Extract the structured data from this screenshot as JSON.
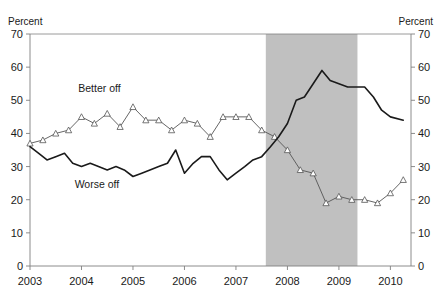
{
  "chart_data": {
    "type": "line",
    "title": "",
    "subtitle": "",
    "xlabel": "",
    "ylabel": "Percent",
    "ylabel_right": "Percent",
    "xlim": [
      2003.0,
      2010.4
    ],
    "ylim": [
      0,
      70
    ],
    "yticks": [
      0,
      10,
      20,
      30,
      40,
      50,
      60,
      70
    ],
    "ytick_labels": [
      "0",
      "10",
      "20",
      "30",
      "40",
      "50",
      "60",
      "70"
    ],
    "xticks": [
      2003,
      2004,
      2005,
      2006,
      2007,
      2008,
      2009,
      2010
    ],
    "xtick_labels": [
      "2003",
      "2004",
      "2005",
      "2006",
      "2007",
      "2008",
      "2009",
      "2010"
    ],
    "grid": false,
    "legend_position": "inline-annotation",
    "annotations": [
      {
        "name": "better-off-label",
        "text": "Better off",
        "x": 2004.35,
        "y": 52.5
      },
      {
        "name": "worse-off-label",
        "text": "Worse off",
        "x": 2004.3,
        "y": 23.5
      }
    ],
    "shaded_regions": [
      {
        "name": "recession-band",
        "x0": 2007.58,
        "x1": 2009.36,
        "color": "#c0c0c0",
        "label": ""
      }
    ],
    "series": [
      {
        "name": "Better off",
        "color": "#555555",
        "marker": "triangle-up",
        "x": [
          2003.0,
          2003.25,
          2003.5,
          2003.75,
          2004.0,
          2004.25,
          2004.5,
          2004.75,
          2005.0,
          2005.25,
          2005.5,
          2005.75,
          2006.0,
          2006.25,
          2006.5,
          2006.75,
          2007.0,
          2007.25,
          2007.5,
          2007.75,
          2008.0,
          2008.25,
          2008.5,
          2008.75,
          2009.0,
          2009.25,
          2009.5,
          2009.75,
          2010.0,
          2010.25
        ],
        "values": [
          37,
          38,
          40,
          41,
          45,
          43,
          46,
          42,
          48,
          44,
          44,
          41,
          44,
          43,
          39,
          45,
          45,
          45,
          41,
          39,
          35,
          29,
          28,
          19,
          21,
          20,
          20,
          19,
          22,
          26
        ]
      },
      {
        "name": "Worse off",
        "color": "#1a1a1a",
        "marker": "none",
        "x": [
          2003.0,
          2003.17,
          2003.33,
          2003.5,
          2003.67,
          2003.83,
          2004.0,
          2004.17,
          2004.33,
          2004.5,
          2004.67,
          2004.83,
          2005.0,
          2005.17,
          2005.33,
          2005.5,
          2005.67,
          2005.83,
          2006.0,
          2006.17,
          2006.33,
          2006.5,
          2006.67,
          2006.83,
          2007.0,
          2007.17,
          2007.33,
          2007.5,
          2007.67,
          2007.83,
          2008.0,
          2008.17,
          2008.33,
          2008.5,
          2008.67,
          2008.83,
          2009.0,
          2009.17,
          2009.33,
          2009.5,
          2009.67,
          2009.83,
          2010.0,
          2010.25
        ],
        "values": [
          36,
          34,
          32,
          33,
          34,
          31,
          30,
          31,
          30,
          29,
          30,
          29,
          27,
          28,
          29,
          30,
          31,
          35,
          28,
          31,
          33,
          33,
          29,
          26,
          28,
          30,
          32,
          33,
          36,
          39,
          43,
          50,
          51,
          55,
          59,
          56,
          55,
          54,
          54,
          54,
          51,
          47,
          45,
          44
        ]
      }
    ]
  },
  "axes": {
    "left_title": "Percent",
    "right_title": "Percent"
  }
}
